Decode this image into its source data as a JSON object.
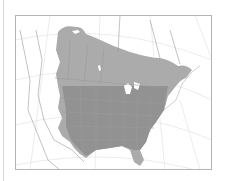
{
  "map": {
    "type": "range-map",
    "region": "North America",
    "colors": {
      "range_fill": "#a8a8a8",
      "range_dark": "#8e8e8e",
      "land": "#ffffff",
      "borders": "#b0b0b0",
      "graticule": "#e2e2e2",
      "frame": "#b4b4b4",
      "background": "#ffffff"
    },
    "legend": []
  }
}
